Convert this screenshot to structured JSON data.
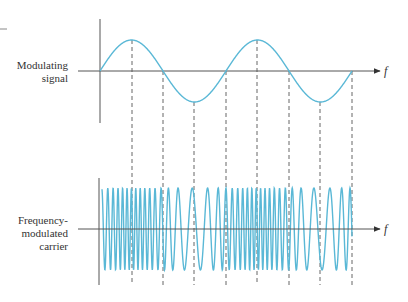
{
  "figure": {
    "top_panel": {
      "label_lines": [
        "Modulating",
        "signal"
      ],
      "axis_label": "f",
      "description": "Two cycles of a sinusoidal modulating signal"
    },
    "bottom_panel": {
      "label_lines": [
        "Frequency-",
        "modulated",
        "carrier"
      ],
      "axis_label": "f",
      "description": "Carrier whose instantaneous frequency rises at modulating peaks and falls at troughs"
    },
    "colors": {
      "signal": "#5ab8d6",
      "axis": "#555555",
      "dashed_guides": "#555555",
      "text": "#333333"
    },
    "guide_positions_x": [
      132,
      163,
      194,
      226,
      257,
      289,
      320,
      352
    ]
  },
  "chart_data": {
    "type": "line",
    "title": "",
    "series": [
      {
        "name": "Modulating signal",
        "function": "sin",
        "cycles": 2,
        "x": [
          0,
          0.25,
          0.5,
          0.75,
          1.0,
          1.25,
          1.5,
          1.75,
          2.0
        ],
        "values": [
          0,
          1,
          0,
          -1,
          0,
          1,
          0,
          -1,
          0
        ]
      },
      {
        "name": "Frequency-modulated carrier",
        "function": "cos(phase integral of carrier + k*modulating)",
        "amplitude": 1,
        "note": "high frequency at modulating peaks (x=0.25, 1.25), low frequency at troughs (x=0.75, 1.75)"
      }
    ],
    "xlabel": "f",
    "ylabel": "",
    "grid": false,
    "legend": "none"
  }
}
